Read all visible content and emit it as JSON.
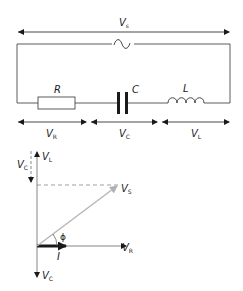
{
  "circuit": {
    "source_label": "V",
    "source_sub": "s",
    "source_symbol": "ac-source",
    "components": [
      {
        "id": "resistor",
        "label": "R"
      },
      {
        "id": "capacitor",
        "label": "C"
      },
      {
        "id": "inductor",
        "label": "L"
      }
    ],
    "voltages": [
      {
        "id": "vr",
        "label": "V",
        "sub": "R"
      },
      {
        "id": "vc",
        "label": "V",
        "sub": "C"
      },
      {
        "id": "vl",
        "label": "V",
        "sub": "L"
      }
    ]
  },
  "phasor": {
    "vl": {
      "label": "V",
      "sub": "L"
    },
    "vc_top": {
      "label": "V",
      "sub": "C"
    },
    "vs": {
      "label": "V",
      "sub": "S"
    },
    "vr": {
      "label": "V",
      "sub": "R"
    },
    "vc_bottom": {
      "label": "V",
      "sub": "C"
    },
    "current": {
      "label": "I"
    },
    "angle": {
      "label": "ϕ"
    },
    "colors": {
      "main": "#1a1a1a",
      "vs": "#b0b0b0",
      "axis": "#555555"
    }
  }
}
